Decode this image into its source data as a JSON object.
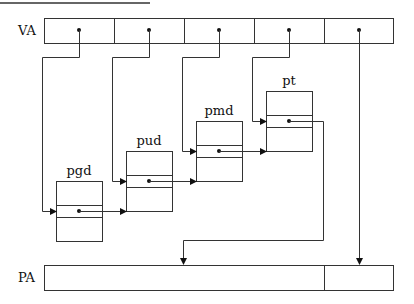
{
  "figure": {
    "type": "multi-level page table translation",
    "top_rule": true
  },
  "va": {
    "label": "VA",
    "fields": 5
  },
  "tables": [
    {
      "name": "pgd"
    },
    {
      "name": "pud"
    },
    {
      "name": "pmd"
    },
    {
      "name": "pt"
    }
  ],
  "pa": {
    "label": "PA",
    "fields": 2
  }
}
